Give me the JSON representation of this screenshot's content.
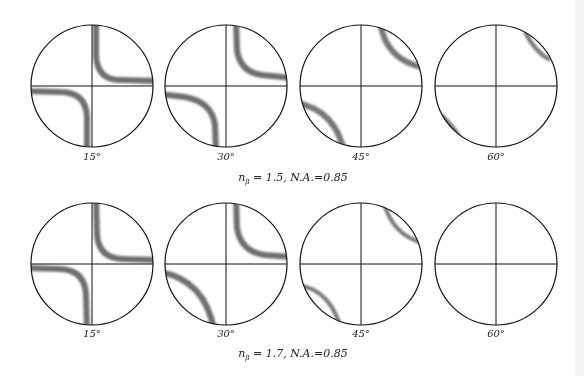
{
  "figure": {
    "rows": [
      {
        "caption_symbol": "n",
        "caption_subscript": "β",
        "caption_rest": "= 1.5, N.A.=0.85",
        "center_y": 86,
        "panels": [
          {
            "angle_label": "15°",
            "cx": 92,
            "pattern": "hyperbola-sharp"
          },
          {
            "angle_label": "30°",
            "cx": 226,
            "pattern": "hyperbola-medium"
          },
          {
            "angle_label": "45°",
            "cx": 361,
            "pattern": "arc-wide"
          },
          {
            "angle_label": "60°",
            "cx": 496,
            "pattern": "arc-edge"
          }
        ]
      },
      {
        "caption_symbol": "n",
        "caption_subscript": "β",
        "caption_rest": "= 1.7, N.A.=0.85",
        "center_y": 264,
        "panels": [
          {
            "angle_label": "15°",
            "cx": 92,
            "pattern": "hyperbola-sharp"
          },
          {
            "angle_label": "30°",
            "cx": 226,
            "pattern": "hyperbola-medium"
          },
          {
            "angle_label": "45°",
            "cx": 361,
            "pattern": "arc-narrow"
          },
          {
            "angle_label": "60°",
            "cx": 496,
            "pattern": "none"
          }
        ]
      }
    ],
    "radius": 61,
    "colors": {
      "line": "#111111",
      "band": "#555555"
    }
  }
}
